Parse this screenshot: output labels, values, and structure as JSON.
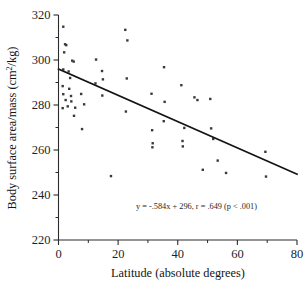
{
  "chart_data": {
    "type": "scatter",
    "title": "",
    "xlabel": "Latitude (absolute degrees)",
    "ylabel": "Body surface area/mass (cm2/kg)",
    "ylabel_parts": {
      "before": "Body surface area/mass (cm",
      "superscript": "2",
      "after": "/kg)"
    },
    "xlim": [
      0,
      80
    ],
    "ylim": [
      220,
      320
    ],
    "xticks": [
      0,
      20,
      40,
      60,
      80
    ],
    "xtick_labels": [
      "0",
      "20",
      "40",
      "60",
      "80"
    ],
    "xminor_ticks": [
      10,
      30,
      50,
      70
    ],
    "yticks": [
      220,
      240,
      260,
      280,
      300,
      320
    ],
    "ytick_labels": [
      "220",
      "240",
      "260",
      "280",
      "300",
      "320"
    ],
    "yminor_ticks": [
      230,
      250,
      270,
      290,
      310
    ],
    "grid": false,
    "legend": false,
    "marker": "square",
    "marker_color": "#3a3a3a",
    "marker_size": 2.4,
    "annotation": "y = -.584x + 296, r = .649 (p < .001)",
    "annotation_x": 26,
    "annotation_y": 234,
    "fit_line": {
      "slope": -0.584,
      "intercept": 296,
      "r": 0.649,
      "p_text": "p < .001",
      "x_start": 0,
      "x_end": 80,
      "y_start": 296,
      "y_end": 249.3,
      "color": "#141414"
    },
    "points": [
      {
        "x": 1.6,
        "y": 314.8
      },
      {
        "x": 2.2,
        "y": 307.0
      },
      {
        "x": 2.6,
        "y": 306.6
      },
      {
        "x": 1.9,
        "y": 303.4
      },
      {
        "x": 4.6,
        "y": 299.7
      },
      {
        "x": 5.1,
        "y": 299.3
      },
      {
        "x": 1.6,
        "y": 295.8
      },
      {
        "x": 3.4,
        "y": 294.9
      },
      {
        "x": 3.9,
        "y": 292.0
      },
      {
        "x": 1.4,
        "y": 288.4
      },
      {
        "x": 3.6,
        "y": 287.2
      },
      {
        "x": 1.6,
        "y": 284.8
      },
      {
        "x": 4.2,
        "y": 284.0
      },
      {
        "x": 7.6,
        "y": 284.9
      },
      {
        "x": 2.4,
        "y": 282.2
      },
      {
        "x": 4.3,
        "y": 281.6
      },
      {
        "x": 3.1,
        "y": 279.4
      },
      {
        "x": 5.6,
        "y": 278.8
      },
      {
        "x": 1.4,
        "y": 278.6
      },
      {
        "x": 8.6,
        "y": 280.3
      },
      {
        "x": 5.2,
        "y": 275.2
      },
      {
        "x": 7.9,
        "y": 269.3
      },
      {
        "x": 12.6,
        "y": 300.2
      },
      {
        "x": 12.4,
        "y": 289.6
      },
      {
        "x": 14.6,
        "y": 295.1
      },
      {
        "x": 14.9,
        "y": 291.4
      },
      {
        "x": 14.7,
        "y": 284.2
      },
      {
        "x": 17.6,
        "y": 248.4
      },
      {
        "x": 22.4,
        "y": 313.4
      },
      {
        "x": 23.1,
        "y": 308.7
      },
      {
        "x": 22.9,
        "y": 291.8
      },
      {
        "x": 22.6,
        "y": 277.1
      },
      {
        "x": 31.2,
        "y": 285.0
      },
      {
        "x": 31.4,
        "y": 268.8
      },
      {
        "x": 31.6,
        "y": 263.0
      },
      {
        "x": 31.5,
        "y": 261.2
      },
      {
        "x": 35.4,
        "y": 296.8
      },
      {
        "x": 35.6,
        "y": 281.4
      },
      {
        "x": 35.3,
        "y": 272.8
      },
      {
        "x": 41.2,
        "y": 288.8
      },
      {
        "x": 41.6,
        "y": 264.0
      },
      {
        "x": 41.7,
        "y": 261.6
      },
      {
        "x": 42.2,
        "y": 269.8
      },
      {
        "x": 45.6,
        "y": 283.4
      },
      {
        "x": 46.6,
        "y": 282.2
      },
      {
        "x": 48.4,
        "y": 251.2
      },
      {
        "x": 50.9,
        "y": 282.7
      },
      {
        "x": 51.2,
        "y": 269.6
      },
      {
        "x": 51.9,
        "y": 264.9
      },
      {
        "x": 53.4,
        "y": 255.3
      },
      {
        "x": 56.2,
        "y": 249.8
      },
      {
        "x": 69.4,
        "y": 259.2
      },
      {
        "x": 69.6,
        "y": 248.2
      }
    ]
  }
}
